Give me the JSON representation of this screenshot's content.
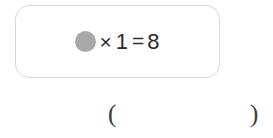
{
  "problem": {
    "equation": {
      "unknown_icon": "gray-filled-circle",
      "unknown_color": "#a9a9a9",
      "operator_multiply": "×",
      "operand": "1",
      "operator_equals": "=",
      "result": "8"
    },
    "card": {
      "border_color": "#d9d9d9",
      "background_color": "#ffffff"
    }
  },
  "answer": {
    "paren_open": "(",
    "paren_close": ")",
    "value": "",
    "text_color": "#3a3a3c"
  }
}
